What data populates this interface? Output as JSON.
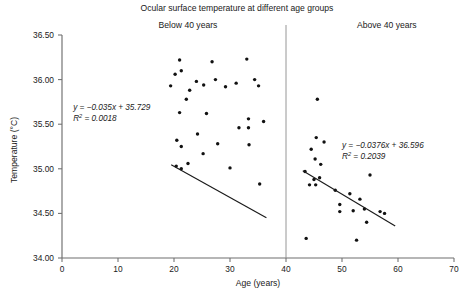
{
  "chart_data": {
    "type": "scatter",
    "title": "Ocular surface temperature at different age groups",
    "xlabel": "Age (years)",
    "ylabel": "Temperature (°C)",
    "xlim": [
      0,
      70
    ],
    "ylim": [
      34.0,
      36.5
    ],
    "xticks": [
      0,
      10,
      20,
      30,
      40,
      50,
      60,
      70
    ],
    "xtick_labels": [
      "0",
      "10",
      "20",
      "30",
      "40",
      "50",
      "60",
      "70"
    ],
    "yticks": [
      34.0,
      34.5,
      35.0,
      35.5,
      36.0,
      36.5
    ],
    "ytick_labels": [
      "34.00",
      "34.50",
      "35.00",
      "35.50",
      "36.00",
      "36.50"
    ],
    "grid": false,
    "legend": "none",
    "divider_x": 40,
    "panels": [
      {
        "name": "below-40",
        "label": "Below 40 years",
        "label_x": 22.5,
        "equation": "y = −0.035x + 35.729",
        "equation_slope": -0.035,
        "equation_intercept": 35.729,
        "r2_prefix": "R",
        "r2_sup": "2",
        "r2_value": "= 0.0018",
        "r2": 0.0018,
        "eq_pos": {
          "x": 2.0,
          "y": 35.66
        },
        "trend_x_range": [
          19.5,
          36.5
        ],
        "points": [
          {
            "x": 19.4,
            "y": 35.93
          },
          {
            "x": 20.2,
            "y": 36.06
          },
          {
            "x": 21.0,
            "y": 36.22
          },
          {
            "x": 21.3,
            "y": 36.1
          },
          {
            "x": 22.8,
            "y": 35.88
          },
          {
            "x": 24.0,
            "y": 35.98
          },
          {
            "x": 25.3,
            "y": 35.94
          },
          {
            "x": 26.8,
            "y": 36.2
          },
          {
            "x": 27.4,
            "y": 36.0
          },
          {
            "x": 29.2,
            "y": 35.92
          },
          {
            "x": 31.1,
            "y": 35.96
          },
          {
            "x": 33.0,
            "y": 36.23
          },
          {
            "x": 34.4,
            "y": 36.0
          },
          {
            "x": 35.1,
            "y": 35.93
          },
          {
            "x": 22.2,
            "y": 35.78
          },
          {
            "x": 21.0,
            "y": 35.63
          },
          {
            "x": 25.8,
            "y": 35.62
          },
          {
            "x": 33.3,
            "y": 35.56
          },
          {
            "x": 33.3,
            "y": 35.46
          },
          {
            "x": 36.0,
            "y": 35.53
          },
          {
            "x": 31.6,
            "y": 35.46
          },
          {
            "x": 24.2,
            "y": 35.39
          },
          {
            "x": 20.5,
            "y": 35.32
          },
          {
            "x": 21.3,
            "y": 35.25
          },
          {
            "x": 27.8,
            "y": 35.28
          },
          {
            "x": 33.4,
            "y": 35.27
          },
          {
            "x": 25.2,
            "y": 35.17
          },
          {
            "x": 22.5,
            "y": 35.06
          },
          {
            "x": 20.4,
            "y": 35.03
          },
          {
            "x": 21.3,
            "y": 35.0
          },
          {
            "x": 30.0,
            "y": 35.01
          },
          {
            "x": 35.3,
            "y": 34.83
          }
        ]
      },
      {
        "name": "above-40",
        "label": "Above 40 years",
        "label_x": 58.0,
        "equation": "y = −0.0376x + 36.596",
        "equation_slope": -0.0376,
        "equation_intercept": 36.596,
        "r2_prefix": "R",
        "r2_sup": "2",
        "r2_value": "= 0.2039",
        "r2": 0.2039,
        "eq_pos": {
          "x": 50.0,
          "y": 35.23
        },
        "trend_x_range": [
          43.0,
          59.5
        ],
        "points": [
          {
            "x": 45.6,
            "y": 35.78
          },
          {
            "x": 45.4,
            "y": 35.35
          },
          {
            "x": 46.8,
            "y": 35.3
          },
          {
            "x": 44.5,
            "y": 35.22
          },
          {
            "x": 45.2,
            "y": 35.11
          },
          {
            "x": 46.2,
            "y": 35.05
          },
          {
            "x": 43.4,
            "y": 34.97
          },
          {
            "x": 45.0,
            "y": 34.88
          },
          {
            "x": 46.0,
            "y": 34.9
          },
          {
            "x": 44.2,
            "y": 34.82
          },
          {
            "x": 45.3,
            "y": 34.82
          },
          {
            "x": 55.0,
            "y": 34.93
          },
          {
            "x": 48.8,
            "y": 34.76
          },
          {
            "x": 51.4,
            "y": 34.72
          },
          {
            "x": 53.2,
            "y": 34.66
          },
          {
            "x": 49.6,
            "y": 34.6
          },
          {
            "x": 49.6,
            "y": 34.52
          },
          {
            "x": 52.0,
            "y": 34.53
          },
          {
            "x": 54.0,
            "y": 34.55
          },
          {
            "x": 56.8,
            "y": 34.52
          },
          {
            "x": 57.6,
            "y": 34.5
          },
          {
            "x": 54.4,
            "y": 34.4
          },
          {
            "x": 43.6,
            "y": 34.22
          },
          {
            "x": 52.6,
            "y": 34.2
          }
        ]
      }
    ]
  }
}
